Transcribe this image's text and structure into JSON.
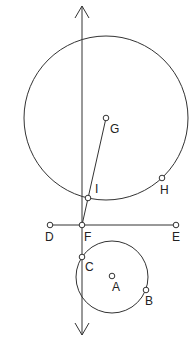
{
  "diagram": {
    "type": "geometry-construction",
    "colors": {
      "stroke": "#333333",
      "background": "#ffffff"
    },
    "vertical_line": {
      "x": 82,
      "y1": 6,
      "y2": 335,
      "arrows": [
        "up",
        "down"
      ]
    },
    "horizontal_segment": {
      "from": "D",
      "to": "E"
    },
    "segment_GI": {
      "from": "G",
      "to": "F"
    },
    "circles": [
      {
        "name": "big-circle",
        "center": "G",
        "cx": 106,
        "cy": 118,
        "r": 82
      },
      {
        "name": "small-circle",
        "center": "A",
        "cx": 112,
        "cy": 277,
        "r": 36
      }
    ],
    "points": [
      {
        "id": "G",
        "label": "G",
        "x": 106,
        "y": 118,
        "lx": 110,
        "ly": 133
      },
      {
        "id": "H",
        "label": "H",
        "x": 162,
        "y": 178,
        "lx": 160,
        "ly": 194
      },
      {
        "id": "I",
        "label": "I",
        "x": 88,
        "y": 198,
        "lx": 95,
        "ly": 193
      },
      {
        "id": "D",
        "label": "D",
        "x": 50,
        "y": 225,
        "lx": 45,
        "ly": 241
      },
      {
        "id": "F",
        "label": "F",
        "x": 82,
        "y": 225,
        "lx": 84,
        "ly": 241
      },
      {
        "id": "E",
        "label": "E",
        "x": 176,
        "y": 225,
        "lx": 172,
        "ly": 241
      },
      {
        "id": "C",
        "label": "C",
        "x": 82,
        "y": 257,
        "lx": 85,
        "ly": 271
      },
      {
        "id": "A",
        "label": "A",
        "x": 112,
        "y": 276,
        "lx": 112,
        "ly": 291
      },
      {
        "id": "B",
        "label": "B",
        "x": 146,
        "y": 290,
        "lx": 145,
        "ly": 305
      }
    ]
  }
}
